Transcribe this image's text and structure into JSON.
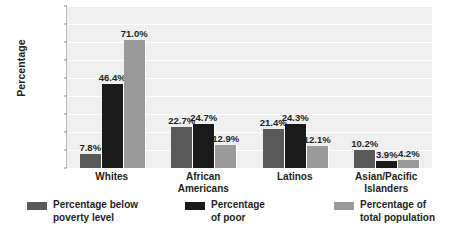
{
  "chart_data": {
    "type": "bar",
    "title": "",
    "xlabel": "",
    "ylabel": "Percentage",
    "ylim": [
      0,
      90
    ],
    "grid": true,
    "legend_position": "bottom",
    "categories": [
      "Whites",
      "African\nAmericans",
      "Latinos",
      "Asian/Pacific\nIslanders"
    ],
    "ticks": [
      "0%",
      "10%",
      "20%",
      "30%",
      "40%",
      "50%",
      "60%",
      "70%",
      "80%",
      "90%"
    ],
    "tick_values": [
      0,
      10,
      20,
      30,
      40,
      50,
      60,
      70,
      80,
      90
    ],
    "series": [
      {
        "name": "Percentage below\npoverty level",
        "color": "#595959",
        "values": [
          7.8,
          22.7,
          21.4,
          10.2
        ],
        "labels": [
          "7.8%",
          "22.7%",
          "21.4%",
          "10.2%"
        ]
      },
      {
        "name": "Percentage\nof poor",
        "color": "#1a1a1a",
        "values": [
          46.4,
          24.7,
          24.3,
          3.9
        ],
        "labels": [
          "46.4%",
          "24.7%",
          "24.3%",
          "3.9%"
        ]
      },
      {
        "name": "Percentage of\ntotal population",
        "color": "#9a9a9a",
        "values": [
          71.0,
          12.9,
          12.1,
          4.2
        ],
        "labels": [
          "71.0%",
          "12.9%",
          "12.1%",
          "4.2%"
        ]
      }
    ],
    "colors": {
      "plot_background": "#efefef",
      "gridline": "#ffffff",
      "text": "#231f20",
      "page_background": "#ffffff"
    }
  }
}
